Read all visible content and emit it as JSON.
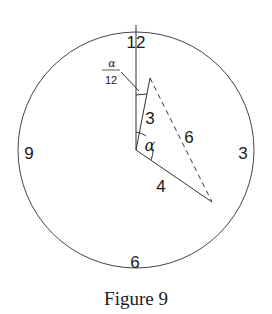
{
  "figure": {
    "caption": "Figure 9",
    "clock": {
      "numerals": {
        "top": "12",
        "right": "3",
        "bottom": "6",
        "left": "9"
      },
      "colors": {
        "stroke": "#333333",
        "background": "#ffffff",
        "text": "#1a1a1a"
      }
    },
    "labels": {
      "hour_hand_length": "3",
      "minute_hand_length": "4",
      "tip_distance": "6",
      "angle_between_hands": "α",
      "hour_hand_offset_numerator": "α",
      "hour_hand_offset_denominator": "12"
    }
  }
}
